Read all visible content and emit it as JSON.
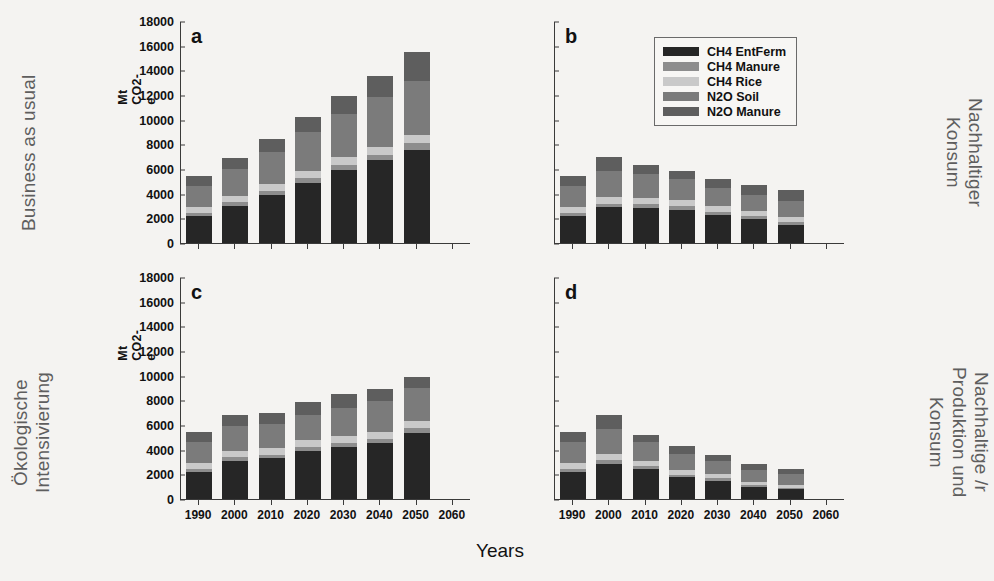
{
  "figure": {
    "xaxis_title": "Years",
    "yaxis_title": "Mt CO2-e",
    "scenario_labels": {
      "top_left": "Business as usual",
      "bottom_left": "Ökologische\nIntensivierung",
      "top_right": "Nachhaltiger\nKonsum",
      "bottom_right": "Nachhaltige /r\nProduktion und\nKonsum"
    }
  },
  "legend": {
    "position": "top-right of panel b",
    "entries": [
      {
        "label": "CH4 EntFerm",
        "color": "#262626"
      },
      {
        "label": "CH4 Manure",
        "color": "#8d8d8d"
      },
      {
        "label": "CH4 Rice",
        "color": "#c9c9c9"
      },
      {
        "label": "N2O Soil",
        "color": "#7b7b7b"
      },
      {
        "label": "N2O Manure",
        "color": "#5e5e5e"
      }
    ]
  },
  "chart_data": {
    "type": "bar",
    "subtype": "stacked",
    "title": "",
    "xlabel": "Years",
    "ylabel": "Mt CO2-e",
    "ylim": [
      0,
      18000
    ],
    "ytick_values": [
      0,
      2000,
      4000,
      6000,
      8000,
      10000,
      12000,
      14000,
      16000,
      18000
    ],
    "ytick_labels": [
      "0",
      "2000",
      "4000",
      "6000",
      "8000",
      "10000",
      "12000",
      "14000",
      "16000",
      "18000"
    ],
    "xlim": [
      1985,
      2065
    ],
    "xtick_values": [
      1990,
      2000,
      2010,
      2020,
      2030,
      2040,
      2050,
      2060
    ],
    "xtick_labels": [
      "1990",
      "2000",
      "2010",
      "2020",
      "2030",
      "2040",
      "2050",
      "2060"
    ],
    "grid": false,
    "categories": [
      1990,
      2000,
      2010,
      2020,
      2030,
      2040,
      2050
    ],
    "series_names": [
      "CH4 EntFerm",
      "CH4 Manure",
      "CH4 Rice",
      "N2O Soil",
      "N2O Manure"
    ],
    "series_colors": [
      "#262626",
      "#8d8d8d",
      "#c9c9c9",
      "#7b7b7b",
      "#5e5e5e"
    ],
    "panels": [
      {
        "id": "a",
        "letter": "a",
        "scenario": "Business as usual",
        "show_ylabel": true,
        "series": [
          {
            "name": "CH4 EntFerm",
            "values": [
              2200,
              3000,
              3900,
              4900,
              5900,
              6700,
              7550
            ]
          },
          {
            "name": "CH4 Manure",
            "values": [
              260,
              300,
              340,
              380,
              420,
              470,
              520
            ]
          },
          {
            "name": "CH4 Rice",
            "values": [
              480,
              520,
              560,
              600,
              620,
              640,
              660
            ]
          },
          {
            "name": "N2O Soil",
            "values": [
              1700,
              2200,
              2600,
              3100,
              3500,
              4000,
              4400
            ]
          },
          {
            "name": "N2O Manure",
            "values": [
              800,
              900,
              1050,
              1250,
              1460,
              1700,
              2350
            ]
          }
        ],
        "totals": [
          5440,
          6920,
          8450,
          10230,
          11900,
          13510,
          15480
        ]
      },
      {
        "id": "b",
        "letter": "b",
        "scenario": "Nachhaltiger Konsum",
        "show_ylabel": false,
        "series": [
          {
            "name": "CH4 EntFerm",
            "values": [
              2200,
              2900,
              2850,
              2700,
              2300,
              1950,
              1500
            ]
          },
          {
            "name": "CH4 Manure",
            "values": [
              260,
              290,
              290,
              280,
              250,
              230,
              200
            ]
          },
          {
            "name": "CH4 Rice",
            "values": [
              480,
              520,
              520,
              500,
              470,
              450,
              430
            ]
          },
          {
            "name": "N2O Soil",
            "values": [
              1700,
              2150,
              1900,
              1700,
              1450,
              1300,
              1250
            ]
          },
          {
            "name": "N2O Manure",
            "values": [
              800,
              1140,
              750,
              700,
              700,
              810,
              890
            ]
          }
        ],
        "totals": [
          5440,
          7000,
          6310,
          5880,
          5170,
          4740,
          4270
        ]
      },
      {
        "id": "c",
        "letter": "c",
        "scenario": "Ökologische Intensivierung",
        "show_ylabel": true,
        "series": [
          {
            "name": "CH4 EntFerm",
            "values": [
              2200,
              3100,
              3300,
              3900,
              4250,
              4550,
              5350
            ]
          },
          {
            "name": "CH4 Manure",
            "values": [
              260,
              290,
              300,
              320,
              330,
              350,
              380
            ]
          },
          {
            "name": "CH4 Rice",
            "values": [
              480,
              510,
              520,
              530,
              540,
              560,
              580
            ]
          },
          {
            "name": "N2O Soil",
            "values": [
              1700,
              2000,
              1950,
              2100,
              2300,
              2450,
              2700
            ]
          },
          {
            "name": "N2O Manure",
            "values": [
              800,
              900,
              900,
              1040,
              1080,
              1030,
              880
            ]
          }
        ],
        "totals": [
          5440,
          6800,
          6970,
          7890,
          8500,
          8940,
          9890
        ]
      },
      {
        "id": "d",
        "letter": "d",
        "scenario": "Nachhaltige /r Produktion und Konsum",
        "show_ylabel": false,
        "series": [
          {
            "name": "CH4 EntFerm",
            "values": [
              2200,
              2850,
              2400,
              1750,
              1500,
              1000,
              800
            ]
          },
          {
            "name": "CH4 Manure",
            "values": [
              260,
              280,
              250,
              210,
              180,
              140,
              120
            ]
          },
          {
            "name": "CH4 Rice",
            "values": [
              480,
              510,
              460,
              400,
              350,
              280,
              250
            ]
          },
          {
            "name": "N2O Soil",
            "values": [
              1700,
              2000,
              1500,
              1300,
              1050,
              900,
              850
            ]
          },
          {
            "name": "N2O Manure",
            "values": [
              800,
              1160,
              570,
              620,
              470,
              500,
              450
            ]
          }
        ],
        "totals": [
          5440,
          6800,
          5180,
          4280,
          3550,
          2820,
          2470
        ]
      }
    ]
  }
}
